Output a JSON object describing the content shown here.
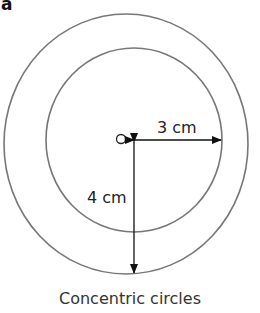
{
  "figure": {
    "label": "a",
    "caption": "Concentric circles",
    "center_marker": "O",
    "radius_labels": {
      "inner": "3 cm",
      "outer": "4 cm"
    }
  },
  "colors": {
    "circle_stroke": "#777777",
    "arrow": "#111111",
    "text": "#222222"
  }
}
